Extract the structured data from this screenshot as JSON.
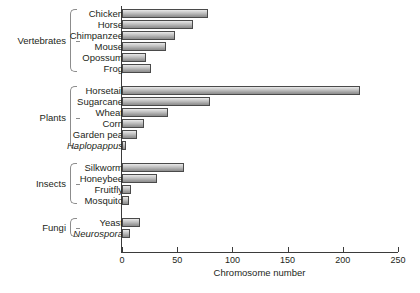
{
  "chart_data": {
    "type": "bar",
    "orientation": "horizontal",
    "title": "",
    "xlabel": "Chromosome number",
    "ylabel": "",
    "xlim": [
      0,
      250
    ],
    "xticks": [
      0,
      50,
      100,
      150,
      200,
      250
    ],
    "grid": false,
    "legend": null,
    "categories": [
      "Chicken",
      "Horse",
      "Chimpanzee",
      "Mouse",
      "Opossum",
      "Frog",
      "Horsetail",
      "Sugarcane",
      "Wheat",
      "Corn",
      "Garden pea",
      "Haplopappus",
      "Silkworm",
      "Honeybee",
      "Fruitfly",
      "Mosquito",
      "Yeast",
      "Neurospora"
    ],
    "values": [
      78,
      64,
      48,
      40,
      22,
      26,
      216,
      80,
      42,
      20,
      14,
      4,
      56,
      32,
      8,
      6,
      16,
      7
    ],
    "groups": [
      {
        "label": "Vertebrates",
        "items": [
          {
            "name": "Chicken",
            "value": 78,
            "italic": false
          },
          {
            "name": "Horse",
            "value": 64,
            "italic": false
          },
          {
            "name": "Chimpanzee",
            "value": 48,
            "italic": false
          },
          {
            "name": "Mouse",
            "value": 40,
            "italic": false
          },
          {
            "name": "Opossum",
            "value": 22,
            "italic": false
          },
          {
            "name": "Frog",
            "value": 26,
            "italic": false
          }
        ]
      },
      {
        "label": "Plants",
        "items": [
          {
            "name": "Horsetail",
            "value": 216,
            "italic": false
          },
          {
            "name": "Sugarcane",
            "value": 80,
            "italic": false
          },
          {
            "name": "Wheat",
            "value": 42,
            "italic": false
          },
          {
            "name": "Corn",
            "value": 20,
            "italic": false
          },
          {
            "name": "Garden pea",
            "value": 14,
            "italic": false
          },
          {
            "name": "Haplopappus",
            "value": 4,
            "italic": true
          }
        ]
      },
      {
        "label": "Insects",
        "items": [
          {
            "name": "Silkworm",
            "value": 56,
            "italic": false
          },
          {
            "name": "Honeybee",
            "value": 32,
            "italic": false
          },
          {
            "name": "Fruitfly",
            "value": 8,
            "italic": false
          },
          {
            "name": "Mosquito",
            "value": 6,
            "italic": false
          }
        ]
      },
      {
        "label": "Fungi",
        "items": [
          {
            "name": "Yeast",
            "value": 16,
            "italic": false
          },
          {
            "name": "Neurospora",
            "value": 7,
            "italic": true
          }
        ]
      }
    ],
    "colors": {
      "bar_fill_light": "#e9e9e9",
      "bar_fill_dark": "#8d8d8d",
      "bar_border": "#4a4a4a",
      "axis": "#3b3b3b",
      "brace": "#8c8c8c",
      "text": "#231f20",
      "background": "#ffffff"
    }
  }
}
